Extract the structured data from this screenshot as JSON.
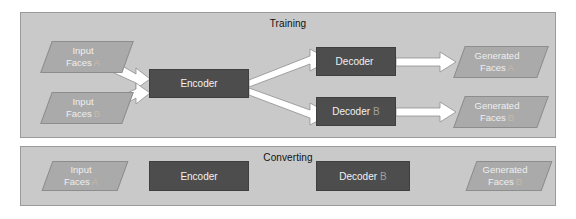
{
  "diagram": {
    "panels": [
      {
        "id": "training",
        "title": "Training",
        "nodes": {
          "input_a": {
            "line1": "Input",
            "line2": "Faces",
            "tag": "A"
          },
          "input_b": {
            "line1": "Input",
            "line2": "Faces",
            "tag": "B"
          },
          "encoder": {
            "label": "Encoder",
            "tag": ""
          },
          "decoder_a": {
            "label": "Decoder",
            "tag": ""
          },
          "decoder_b": {
            "label": "Decoder",
            "tag": "B"
          },
          "generated_a": {
            "line1": "Generated",
            "line2": "Faces",
            "tag": "A"
          },
          "generated_b": {
            "line1": "Generated",
            "line2": "Faces",
            "tag": "B"
          }
        }
      },
      {
        "id": "converting",
        "title": "Converting",
        "nodes": {
          "input_a": {
            "line1": "Input",
            "line2": "Faces",
            "tag": "A"
          },
          "encoder": {
            "label": "Encoder",
            "tag": ""
          },
          "decoder_b": {
            "label": "Decoder",
            "tag": "B"
          },
          "generated_b": {
            "line1": "Generated",
            "line2": "Faces",
            "tag": "B"
          }
        }
      }
    ],
    "colors": {
      "panel_fill": "#c9c9c9",
      "panel_border": "#9a9a9a",
      "box_fill": "#4d4d4d",
      "parallelogram_fill": "#aaaaaa",
      "arrow_fill": "#ffffff",
      "arrow_stroke": "#8a8a8a",
      "text_light": "#efefef",
      "text_dark": "#111111",
      "tag_color": "#c8b8a8"
    }
  }
}
